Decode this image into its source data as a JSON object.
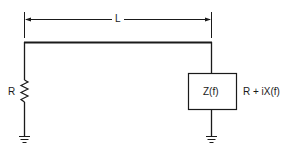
{
  "diagram": {
    "type": "transmission-line circuit",
    "length_label": "L",
    "source_resistor_label": "R",
    "load_box_label": "Z(f)",
    "load_expression": "R + iX(f)",
    "line_color": "#1a1a1a"
  }
}
